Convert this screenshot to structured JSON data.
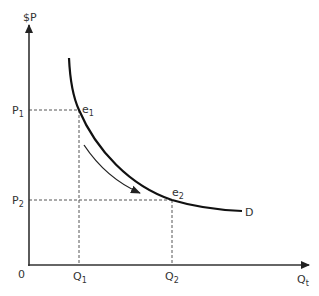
{
  "diagram": {
    "type": "demand_curve",
    "y_axis_label": "$P",
    "x_axis_label": {
      "base": "Q",
      "sub": "t"
    },
    "origin_label": "0",
    "price_levels": [
      {
        "base": "P",
        "sub": "1"
      },
      {
        "base": "P",
        "sub": "2"
      }
    ],
    "quantity_levels": [
      {
        "base": "Q",
        "sub": "1"
      },
      {
        "base": "Q",
        "sub": "2"
      }
    ],
    "points": [
      {
        "base": "e",
        "sub": "1"
      },
      {
        "base": "e",
        "sub": "2"
      }
    ],
    "curve_label": "D",
    "movement": "along curve from e1 to e2",
    "colors": {
      "axis": "#333333",
      "curve": "#111111",
      "guides": "#555555",
      "text": "#333333"
    }
  }
}
